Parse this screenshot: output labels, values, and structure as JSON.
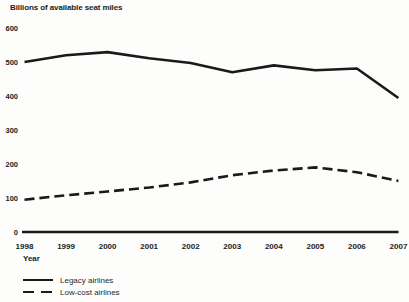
{
  "colors": {
    "ink": "#1a1a1a",
    "background": "#fdfdfb"
  },
  "chart_data": {
    "type": "line",
    "title": "Billions of available seat miles",
    "xlabel": "Year",
    "ylabel": "",
    "categories": [
      "1998",
      "1999",
      "2000",
      "2001",
      "2002",
      "2003",
      "2004",
      "2005",
      "2006",
      "2007"
    ],
    "series": [
      {
        "name": "Legacy airlines",
        "line_style": "solid",
        "color": "#1a1a1a",
        "values": [
          500,
          520,
          529,
          511,
          497,
          470,
          490,
          476,
          481,
          394
        ]
      },
      {
        "name": "Low-cost airlines",
        "line_style": "dashed",
        "color": "#1a1a1a",
        "values": [
          95,
          108,
          119,
          131,
          146,
          167,
          181,
          190,
          176,
          150
        ]
      }
    ],
    "ylim": [
      0,
      600
    ],
    "yticks": [
      0,
      100,
      200,
      300,
      400,
      500,
      600
    ],
    "grid": false,
    "legend_position": "bottom-left"
  }
}
